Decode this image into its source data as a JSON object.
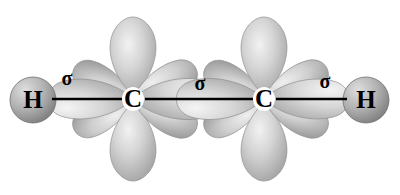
{
  "diagram": {
    "molecule": "C2H2",
    "background_color": "#ffffff",
    "bond_line_color": "#000000",
    "orbital_fill_light": "#e8e8e8",
    "orbital_fill_mid": "#c6c6c6",
    "orbital_fill_dark": "#9a9a9a",
    "orbital_stroke": "#8c8c8c",
    "sphere_fill_light": "#d2d2d2",
    "sphere_fill_dark": "#8f8f8f",
    "sphere_stroke": "#6f6f6f",
    "atoms": [
      {
        "id": "h-left",
        "label": "H",
        "x": 33,
        "y": 100,
        "type": "hydrogen"
      },
      {
        "id": "c-left",
        "label": "C",
        "x": 133,
        "y": 99,
        "type": "carbon"
      },
      {
        "id": "c-right",
        "label": "C",
        "x": 264,
        "y": 99,
        "type": "carbon"
      },
      {
        "id": "h-right",
        "label": "H",
        "x": 366,
        "y": 100,
        "type": "hydrogen"
      }
    ],
    "bonds": [
      {
        "id": "bond-h-c-left",
        "label": "σ",
        "label_x": 67,
        "label_y": 80,
        "x1": 52,
        "x2": 122,
        "y": 99
      },
      {
        "id": "bond-c-c",
        "label": "σ",
        "label_x": 200,
        "label_y": 85,
        "x1": 145,
        "x2": 253,
        "y": 99
      },
      {
        "id": "bond-h-c-right",
        "label": "σ",
        "label_x": 325,
        "label_y": 83,
        "x1": 276,
        "x2": 347,
        "y": 99
      }
    ]
  }
}
